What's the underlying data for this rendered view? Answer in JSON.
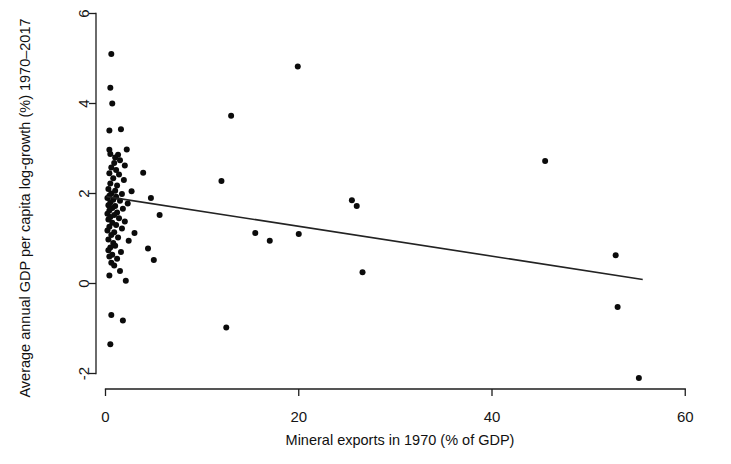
{
  "figure": {
    "width": 731,
    "height": 464,
    "background": "#ffffff",
    "ink_color": "#0b0b0b",
    "line_color": "#232323"
  },
  "chart_data": {
    "type": "scatter",
    "title": "",
    "xlabel": "Mineral exports in 1970 (% of GDP)",
    "ylabel": "Average annual GDP per capita log-growth (%) 1970–2017",
    "xlim": [
      -1.5,
      62
    ],
    "ylim": [
      -2.6,
      6.3
    ],
    "xticks": [
      0,
      20,
      40,
      60
    ],
    "xticklabels": [
      "0",
      "20",
      "40",
      "60"
    ],
    "yticks": [
      -2,
      0,
      2,
      4,
      6
    ],
    "yticklabels": [
      "-2",
      "0",
      "2",
      "4",
      "6"
    ],
    "grid": false,
    "legend": null,
    "marker": "filled-circle",
    "marker_size_px": 6,
    "points": [
      [
        0.6,
        5.1
      ],
      [
        0.5,
        4.35
      ],
      [
        0.7,
        4.0
      ],
      [
        0.4,
        3.4
      ],
      [
        1.6,
        3.43
      ],
      [
        0.4,
        2.97
      ],
      [
        2.2,
        2.98
      ],
      [
        0.5,
        2.88
      ],
      [
        1.3,
        2.86
      ],
      [
        1.0,
        2.8
      ],
      [
        1.5,
        2.74
      ],
      [
        0.9,
        2.68
      ],
      [
        2.0,
        2.62
      ],
      [
        0.6,
        2.58
      ],
      [
        1.1,
        2.52
      ],
      [
        0.4,
        2.45
      ],
      [
        1.4,
        2.42
      ],
      [
        3.9,
        2.46
      ],
      [
        0.8,
        2.34
      ],
      [
        1.9,
        2.3
      ],
      [
        12.0,
        2.28
      ],
      [
        0.5,
        2.22
      ],
      [
        1.2,
        2.18
      ],
      [
        0.3,
        2.1
      ],
      [
        1.0,
        2.06
      ],
      [
        2.7,
        2.05
      ],
      [
        0.6,
        2.0
      ],
      [
        1.7,
        1.99
      ],
      [
        0.4,
        1.95
      ],
      [
        1.1,
        1.93
      ],
      [
        0.2,
        1.9
      ],
      [
        4.7,
        1.9
      ],
      [
        0.8,
        1.86
      ],
      [
        1.5,
        1.84
      ],
      [
        0.5,
        1.8
      ],
      [
        2.3,
        1.78
      ],
      [
        0.3,
        1.74
      ],
      [
        1.0,
        1.72
      ],
      [
        0.7,
        1.68
      ],
      [
        1.8,
        1.66
      ],
      [
        0.4,
        1.62
      ],
      [
        1.2,
        1.58
      ],
      [
        0.2,
        1.55
      ],
      [
        0.9,
        1.52
      ],
      [
        5.6,
        1.52
      ],
      [
        0.5,
        1.48
      ],
      [
        1.4,
        1.45
      ],
      [
        0.3,
        1.42
      ],
      [
        2.0,
        1.38
      ],
      [
        0.7,
        1.35
      ],
      [
        1.1,
        1.3
      ],
      [
        0.4,
        1.26
      ],
      [
        1.7,
        1.22
      ],
      [
        0.2,
        1.18
      ],
      [
        0.9,
        1.14
      ],
      [
        3.0,
        1.12
      ],
      [
        0.6,
        1.08
      ],
      [
        1.3,
        1.02
      ],
      [
        0.3,
        0.98
      ],
      [
        2.4,
        0.95
      ],
      [
        0.8,
        0.9
      ],
      [
        1.0,
        0.84
      ],
      [
        0.5,
        0.8
      ],
      [
        4.4,
        0.78
      ],
      [
        0.3,
        0.74
      ],
      [
        1.6,
        0.7
      ],
      [
        0.7,
        0.64
      ],
      [
        0.4,
        0.6
      ],
      [
        1.2,
        0.55
      ],
      [
        5.0,
        0.52
      ],
      [
        0.6,
        0.46
      ],
      [
        0.9,
        0.4
      ],
      [
        1.5,
        0.28
      ],
      [
        0.4,
        0.18
      ],
      [
        2.1,
        0.06
      ],
      [
        0.6,
        -0.7
      ],
      [
        1.8,
        -0.82
      ],
      [
        0.5,
        -1.35
      ],
      [
        19.9,
        4.82
      ],
      [
        13.0,
        3.73
      ],
      [
        25.5,
        1.85
      ],
      [
        26.0,
        1.72
      ],
      [
        15.5,
        1.12
      ],
      [
        17.0,
        0.95
      ],
      [
        20.0,
        1.1
      ],
      [
        26.6,
        0.25
      ],
      [
        12.5,
        -0.98
      ],
      [
        45.5,
        2.72
      ],
      [
        52.8,
        0.63
      ],
      [
        53.0,
        -0.52
      ],
      [
        55.2,
        -2.1
      ]
    ],
    "fit_line": {
      "label": "linear fit",
      "x_start": 0.1,
      "y_start": 1.93,
      "x_end": 55.6,
      "y_end": 0.09
    }
  }
}
